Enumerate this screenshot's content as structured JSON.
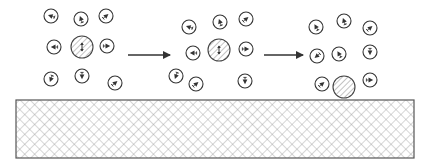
{
  "diagram": {
    "title": "",
    "colors": {
      "stroke": "#333333",
      "hatch": "#888888",
      "background": "#ffffff"
    },
    "stages": [
      {
        "id": "stage-1",
        "central_particle": {
          "cx": 82,
          "cy": 47,
          "r": 11,
          "glyph": "double-vertical-arrow"
        },
        "molecules": [
          {
            "cx": 51,
            "cy": 16,
            "angle": 200
          },
          {
            "cx": 81,
            "cy": 19,
            "angle": 250
          },
          {
            "cx": 106,
            "cy": 16,
            "angle": 320
          },
          {
            "cx": 54,
            "cy": 47,
            "angle": 180
          },
          {
            "cx": 107,
            "cy": 46,
            "angle": 0
          },
          {
            "cx": 51,
            "cy": 79,
            "angle": 110
          },
          {
            "cx": 82,
            "cy": 76,
            "angle": 90
          },
          {
            "cx": 115,
            "cy": 83,
            "angle": 320
          }
        ]
      },
      {
        "id": "stage-2",
        "central_particle": {
          "cx": 219,
          "cy": 50,
          "r": 11,
          "glyph": "double-vertical-arrow"
        },
        "molecules": [
          {
            "cx": 189,
            "cy": 27,
            "angle": 200
          },
          {
            "cx": 220,
            "cy": 22,
            "angle": 250
          },
          {
            "cx": 246,
            "cy": 19,
            "angle": 320
          },
          {
            "cx": 193,
            "cy": 53,
            "angle": 180
          },
          {
            "cx": 246,
            "cy": 49,
            "angle": 0
          },
          {
            "cx": 176,
            "cy": 76,
            "angle": 110
          },
          {
            "cx": 196,
            "cy": 84,
            "angle": 320
          },
          {
            "cx": 245,
            "cy": 81,
            "angle": 90
          }
        ]
      },
      {
        "id": "stage-3",
        "central_particle": {
          "cx": 344,
          "cy": 87,
          "r": 11,
          "glyph": "none"
        },
        "molecules": [
          {
            "cx": 316,
            "cy": 27,
            "angle": 240
          },
          {
            "cx": 344,
            "cy": 21,
            "angle": 250
          },
          {
            "cx": 370,
            "cy": 28,
            "angle": 320
          },
          {
            "cx": 317,
            "cy": 56,
            "angle": 140
          },
          {
            "cx": 339,
            "cy": 54,
            "angle": 240
          },
          {
            "cx": 370,
            "cy": 52,
            "angle": 90
          },
          {
            "cx": 322,
            "cy": 84,
            "angle": 320
          },
          {
            "cx": 370,
            "cy": 80,
            "angle": 0
          }
        ]
      }
    ],
    "arrows": [
      {
        "id": "arrow-1",
        "x1": 128,
        "y1": 55,
        "x2": 170,
        "y2": 55
      },
      {
        "id": "arrow-2",
        "x1": 264,
        "y1": 55,
        "x2": 303,
        "y2": 55
      }
    ],
    "substrate": {
      "x": 16,
      "y": 100,
      "width": 398,
      "height": 58,
      "pattern": "cross-hatch"
    },
    "molecule_radius": 7
  }
}
